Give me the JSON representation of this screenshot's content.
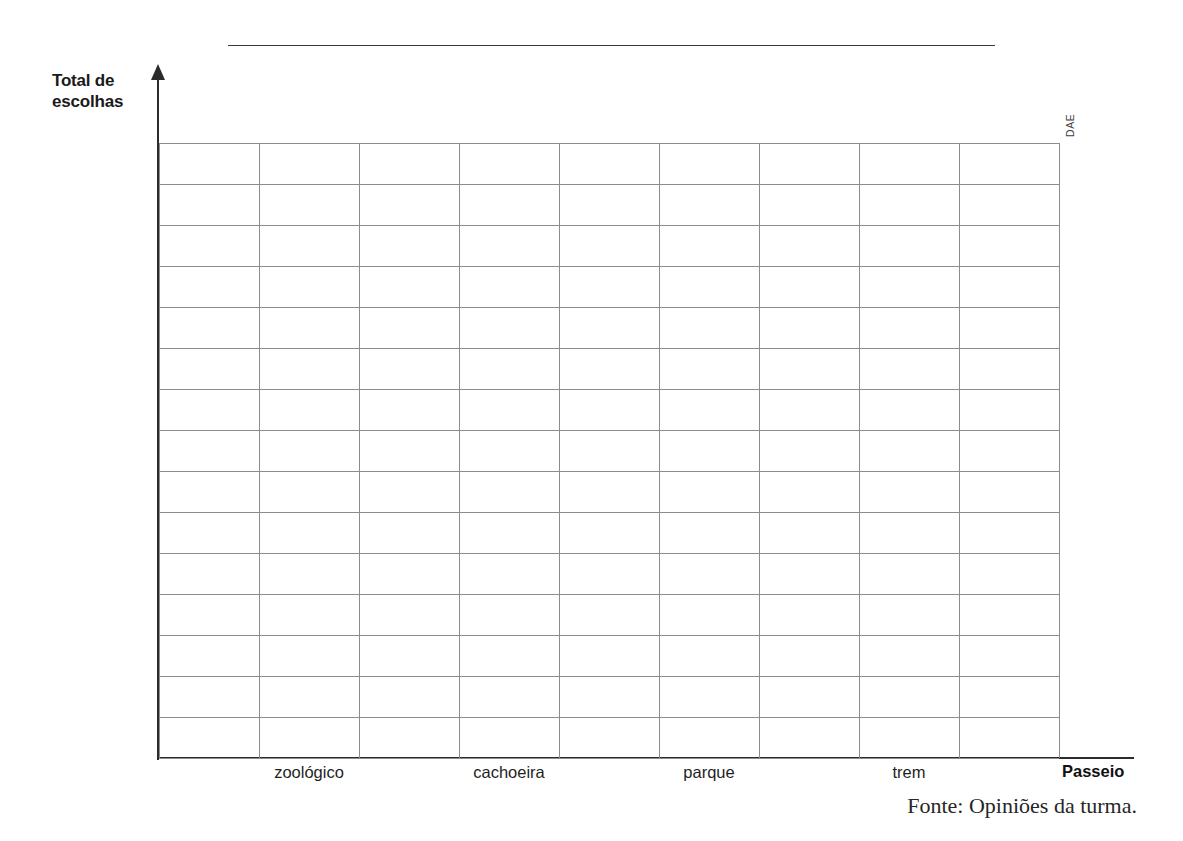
{
  "page": {
    "background_color": "#ffffff",
    "ink_color": "#1c1c1c",
    "grid_line_color": "#8c8c8c",
    "axis_color": "#2b2b2b"
  },
  "title_rule": {
    "label": "",
    "note": "blank ruled line reserved for the chart title"
  },
  "axes": {
    "y_label_line1": "Total de",
    "y_label_line2": "escolhas",
    "x_title": "Passeio"
  },
  "credit": {
    "text": "DAE"
  },
  "source": {
    "text": "Fonte: Opiniões da turma."
  },
  "chart_data": {
    "type": "bar",
    "title": "",
    "xlabel": "Passeio",
    "ylabel": "Total de escolhas",
    "categories": [
      "zoológico",
      "cachoeira",
      "parque",
      "trem"
    ],
    "values": [
      null,
      null,
      null,
      null
    ],
    "series": [
      {
        "name": "Total de escolhas",
        "values": [
          null,
          null,
          null,
          null
        ]
      }
    ],
    "grid": true,
    "grid_columns": 9,
    "grid_rows": 15,
    "ylim": [
      0,
      15
    ],
    "ytick_labels": [],
    "legend": "none",
    "annotations": [
      "Fonte: Opiniões da turma.",
      "DAE"
    ],
    "category_label_columns": [
      2,
      4,
      6,
      8
    ]
  },
  "grid_layout": {
    "rows": 15,
    "columns": 9,
    "cell_width_px": 100,
    "cell_height_px": 41
  }
}
